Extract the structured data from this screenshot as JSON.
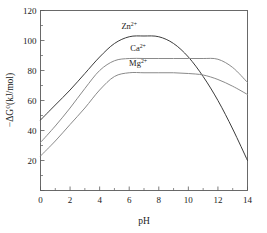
{
  "chart_data": {
    "type": "line",
    "title": "",
    "xlabel": "pH",
    "ylabel": "−ΔG⁰(kJ/mol)",
    "xlim": [
      0,
      14
    ],
    "ylim": [
      0,
      120
    ],
    "xticks": [
      0,
      2,
      4,
      6,
      8,
      10,
      12,
      14
    ],
    "yticks": [
      0,
      20,
      40,
      60,
      80,
      100,
      120
    ],
    "xtick_labels": [
      "0",
      "2",
      "4",
      "6",
      "8",
      "10",
      "12",
      "14"
    ],
    "ytick_labels": [
      "",
      "20",
      "40",
      "60",
      "80",
      "100",
      "120"
    ],
    "grid": false,
    "legend_position": "inline-annotations",
    "minor_ticks": true,
    "x": [
      0,
      1,
      2,
      3,
      4,
      5,
      6,
      7,
      8,
      9,
      10,
      11,
      12,
      13,
      14
    ],
    "series": [
      {
        "name": "Zn2+",
        "label": "Zn",
        "charge": "2+",
        "color": "#3c3c3c",
        "values": [
          47,
          57,
          67,
          78,
          89,
          98,
          102.5,
          103,
          102.5,
          98,
          89,
          76,
          60,
          41,
          20
        ]
      },
      {
        "name": "Ca2+",
        "label": "Ca",
        "charge": "2+",
        "color": "#8a8a8a",
        "values": [
          32,
          43,
          55,
          68,
          80,
          86.5,
          88,
          88,
          88,
          88,
          88,
          88,
          87.5,
          82,
          72
        ]
      },
      {
        "name": "Mg2+",
        "label": "Mg",
        "charge": "2+",
        "color": "#8a8a8a",
        "values": [
          23,
          33,
          44,
          55,
          67,
          76,
          78.5,
          78.5,
          78.5,
          78.5,
          78,
          77,
          74,
          69.5,
          64
        ]
      }
    ],
    "annotations": [
      {
        "text": "Zn",
        "sup": "2+",
        "x": 6.0,
        "y": 108,
        "series": "Zn2+"
      },
      {
        "text": "Ca",
        "sup": "2+",
        "x": 6.6,
        "y": 93,
        "series": "Ca2+"
      },
      {
        "text": "Mg",
        "sup": "2+",
        "x": 6.6,
        "y": 83,
        "series": "Mg2+"
      }
    ]
  }
}
